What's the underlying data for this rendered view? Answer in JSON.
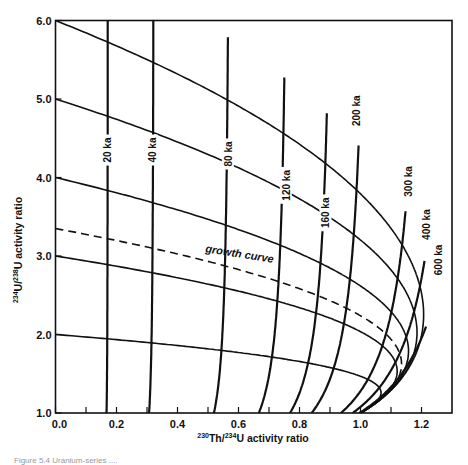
{
  "chart_data": {
    "type": "line",
    "title": "",
    "xlabel": "230Th/234U activity ratio",
    "xlabel_parts": {
      "sup1": "230",
      "mid1": "Th/",
      "sup2": "234",
      "mid2": "U activity ratio"
    },
    "ylabel": "234U/238U activity ratio",
    "ylabel_parts": {
      "sup1": "234",
      "mid1": "U/",
      "sup2": "238",
      "mid2": "U activity ratio"
    },
    "xlim": [
      0.0,
      1.3
    ],
    "ylim": [
      1.0,
      6.0
    ],
    "x_ticks_major": [
      0.0,
      0.2,
      0.4,
      0.6,
      0.8,
      1.0,
      1.2
    ],
    "x_tick_labels": [
      "0.0",
      "0.2",
      "0.4",
      "0.6",
      "0.8",
      "1.0",
      "1.2"
    ],
    "x_ticks_minor": [
      0.1,
      0.3,
      0.5,
      0.7,
      0.9,
      1.1
    ],
    "y_ticks_major": [
      1.0,
      2.0,
      3.0,
      4.0,
      5.0,
      6.0
    ],
    "y_tick_labels": [
      "1.0",
      "2.0",
      "3.0",
      "4.0",
      "5.0",
      "6.0"
    ],
    "grid": false,
    "legend": "none",
    "decay_constants_per_yr": {
      "th230": 9.1577e-06,
      "u234": 2.8263e-06
    },
    "initial_ratio_curves": [
      {
        "name": "initial 234U/238U = 6.0",
        "initial": 6.0,
        "style": "solid"
      },
      {
        "name": "initial 234U/238U = 5.0",
        "initial": 5.0,
        "style": "solid"
      },
      {
        "name": "initial 234U/238U = 4.0",
        "initial": 4.0,
        "style": "solid"
      },
      {
        "name": "initial 234U/238U = 3.0",
        "initial": 3.0,
        "style": "solid"
      },
      {
        "name": "growth curve",
        "initial": 3.35,
        "style": "dashed"
      },
      {
        "name": "initial 234U/238U = 2.0",
        "initial": 2.0,
        "style": "solid"
      }
    ],
    "isochrons": [
      {
        "label": "20 ka",
        "age_ka": 20,
        "label_at": {
          "x": 0.17,
          "y": 4.35
        }
      },
      {
        "label": "40 ka",
        "age_ka": 40,
        "label_at": {
          "x": 0.315,
          "y": 4.35
        }
      },
      {
        "label": "80 ka",
        "age_ka": 80,
        "label_at": {
          "x": 0.565,
          "y": 4.3
        }
      },
      {
        "label": "120 ka",
        "age_ka": 120,
        "label_at": {
          "x": 0.755,
          "y": 3.9
        }
      },
      {
        "label": "160 ka",
        "age_ka": 160,
        "label_at": {
          "x": 0.885,
          "y": 3.55
        }
      },
      {
        "label": "200 ka",
        "age_ka": 200,
        "label_at": {
          "x": 0.985,
          "y": 4.85
        }
      },
      {
        "label": "300 ka",
        "age_ka": 300,
        "label_at": {
          "x": 1.155,
          "y": 3.95
        }
      },
      {
        "label": "400 ka",
        "age_ka": 400,
        "label_at": {
          "x": 1.215,
          "y": 3.4
        }
      },
      {
        "label": "600 ka",
        "age_ka": 600,
        "label_at": {
          "x": 1.255,
          "y": 2.95
        }
      }
    ],
    "equilibrium_curve": {
      "name": "infinite age limit",
      "age_ka": 5000
    }
  },
  "annotations": {
    "growth_curve_label": "growth curve",
    "growth_curve_label_at": {
      "x": 0.49,
      "y": 3.05
    }
  },
  "caption": "Figure 5.4  Uranium-series ...."
}
